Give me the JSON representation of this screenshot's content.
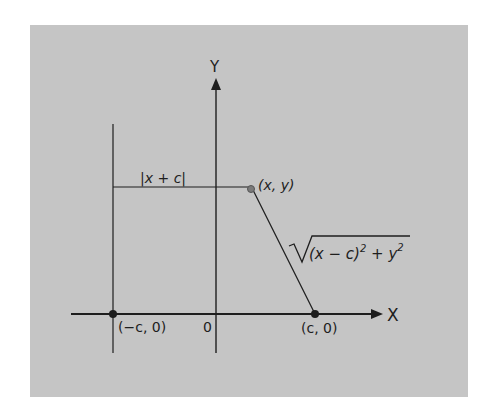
{
  "diagram": {
    "background_color": "#c5c5c5",
    "ink_color": "#1e1e1e",
    "axes": {
      "x_label": "X",
      "y_label": "Y",
      "origin_label": "0"
    },
    "points": {
      "left_focus": "(−c, 0)",
      "right_focus": "(c, 0)",
      "point": "(x, y)"
    },
    "distances": {
      "horizontal": "|x + c|",
      "slant_prefix": "(x − c)",
      "slant_exp1": "2",
      "slant_mid": " + y",
      "slant_exp2": "2"
    }
  }
}
